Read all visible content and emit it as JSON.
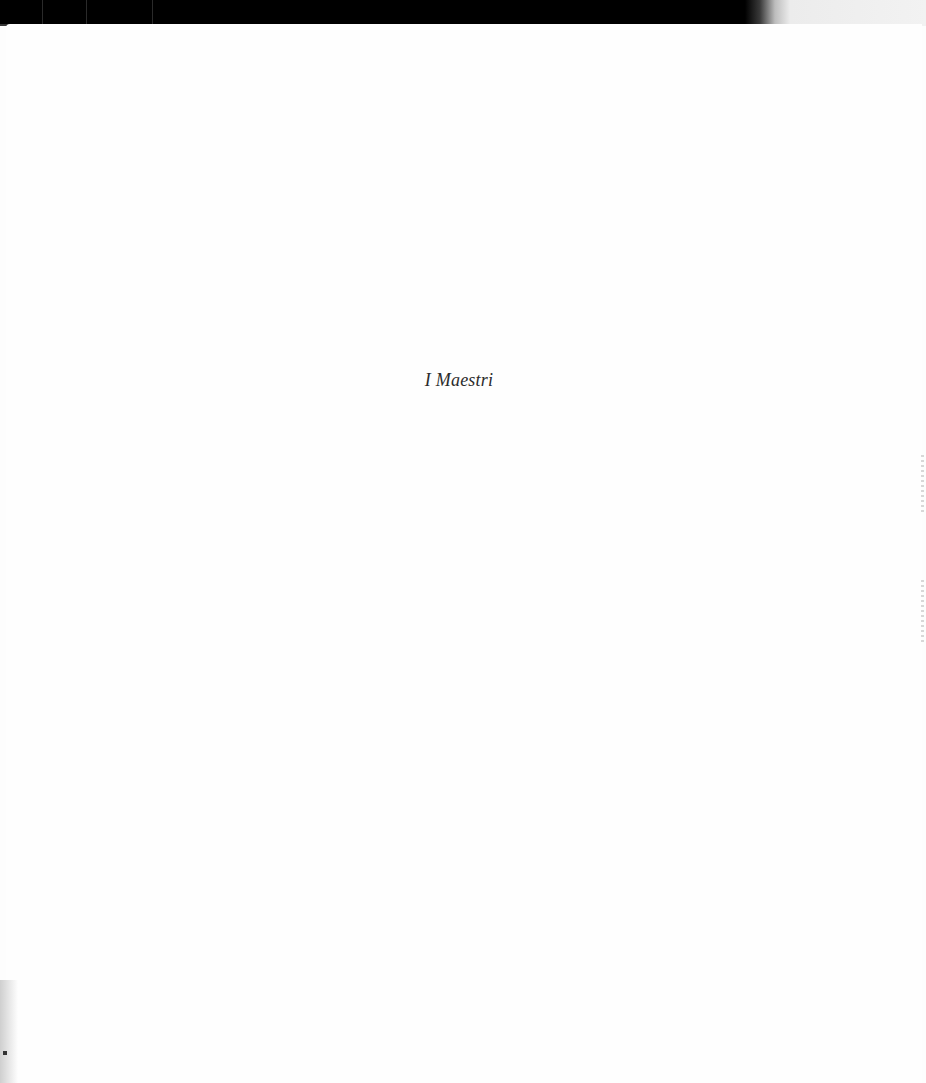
{
  "page": {
    "title": "I Maestri"
  },
  "colors": {
    "top_band": "#000000",
    "paper": "#fefefe",
    "text": "#2b2b2b"
  }
}
